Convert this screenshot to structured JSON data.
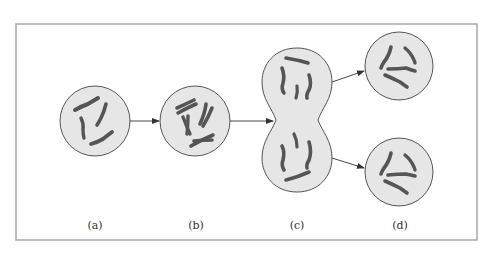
{
  "diagram": {
    "type": "cell-division-stages",
    "colors": {
      "frame": "#9a9a9a",
      "cell_fill": "#e6e6e6",
      "cell_stroke": "#555555",
      "chromosome_fill": "#7a7a7a",
      "chromosome_stroke": "#444444",
      "arrow": "#333333"
    },
    "stages": [
      {
        "id": "a",
        "label": "(a)"
      },
      {
        "id": "b",
        "label": "(b)"
      },
      {
        "id": "c",
        "label": "(c)"
      },
      {
        "id": "d",
        "label": "(d)"
      }
    ]
  }
}
